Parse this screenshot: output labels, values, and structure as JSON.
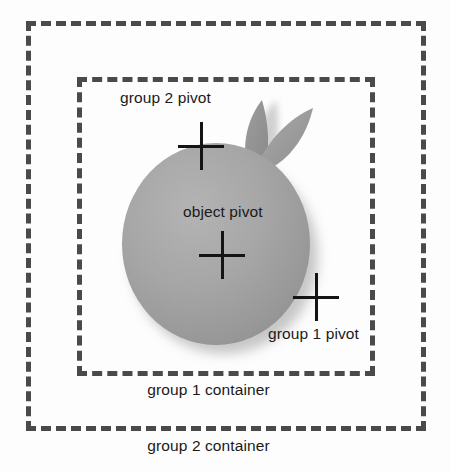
{
  "diagram": {
    "title_visible": false,
    "background_color": "#fdfdfd",
    "outline_color": "#4a4a4a",
    "text_color": "#1a1a1a",
    "shape_fill_color": "#a3a3a3",
    "shape_shadow_color": "#c9c9c9"
  },
  "containers": [
    {
      "id": "group1",
      "label": "group 1 container",
      "style": "dashed",
      "x": 77,
      "y": 77,
      "width": 298,
      "height": 299
    },
    {
      "id": "group2",
      "label": "group 2 container",
      "style": "dashed",
      "x": 26,
      "y": 21,
      "width": 400,
      "height": 410
    }
  ],
  "pivots": [
    {
      "id": "group2_pivot",
      "label": "group 2 pivot",
      "x": 201,
      "y": 146,
      "marker": "cross-icon"
    },
    {
      "id": "object_pivot",
      "label": "object pivot",
      "x": 222,
      "y": 255,
      "marker": "cross-icon"
    },
    {
      "id": "group1_pivot",
      "label": "group 1 pivot",
      "x": 316,
      "y": 297,
      "marker": "cross-icon"
    }
  ],
  "object": {
    "name": "fruit-shape",
    "description": "gray sphere with two pointed leaves",
    "center_x": 216,
    "center_y": 244,
    "radius_x": 94,
    "radius_y": 101
  }
}
